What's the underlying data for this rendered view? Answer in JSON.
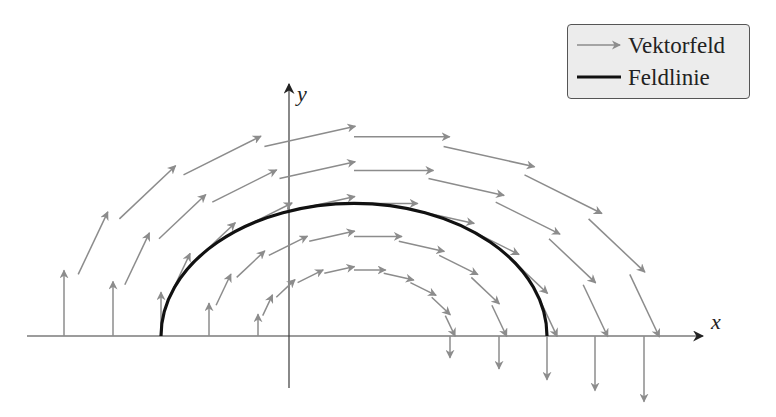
{
  "chart_data": {
    "type": "vector-field",
    "title": "",
    "xlabel": "x",
    "ylabel": "y",
    "grid": false,
    "legend": {
      "position": "upper right",
      "entries": [
        {
          "label": "Vektorfeld",
          "style": "gray arrow"
        },
        {
          "label": "Feldlinie",
          "style": "thick black line"
        }
      ]
    },
    "field_description": "Circular (rotational) field around a center on the x-axis to the right of the origin, arrows tangential clockwise, length proportional to radius; drawn in upper half-plane only",
    "center_px": [
      354,
      336
    ],
    "vertical_scale": 0.687,
    "ring_radii_px": [
      96,
      145,
      193,
      241,
      290
    ],
    "angle_step_deg": 18,
    "arrow_scale": 0.33,
    "field_line": {
      "type": "semi-ellipse",
      "radius_px": 193,
      "x_start_px": 162,
      "x_end_px": 547,
      "top_y_px": 203
    }
  },
  "style": {
    "arrow_color": "#8c8c8c",
    "field_line_color": "#111111",
    "axis_color": "#3a3a3a",
    "legend_bg": "#ececec"
  },
  "axes": {
    "x_axis": {
      "x1": 27,
      "x2": 703,
      "y": 336,
      "label": "x"
    },
    "y_axis": {
      "x": 289,
      "y1": 388,
      "y2": 84,
      "label": "y"
    }
  },
  "legend": {
    "vector_field_label": "Vektorfeld",
    "field_line_label": "Feldlinie"
  }
}
